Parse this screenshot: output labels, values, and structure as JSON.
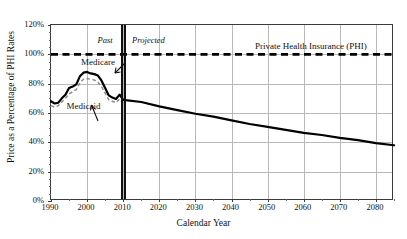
{
  "chart_data": {
    "type": "line",
    "title": "",
    "xlabel": "Calendar Year",
    "ylabel": "Price as a Percentage of PHI Rates",
    "xlim": [
      1990,
      2085
    ],
    "ylim": [
      0,
      120
    ],
    "grid": true,
    "legend_position": "inline-annotations",
    "xticks": [
      1990,
      2000,
      2010,
      2020,
      2030,
      2040,
      2050,
      2060,
      2070,
      2080
    ],
    "xtick_labels": [
      "1990",
      "2000",
      "2010",
      "2020",
      "2030",
      "2040",
      "2050",
      "2060",
      "2070",
      "2080"
    ],
    "yticks": [
      0,
      20,
      40,
      60,
      80,
      100,
      120
    ],
    "ytick_labels": [
      "0%",
      "20%",
      "40%",
      "60%",
      "80%",
      "100%",
      "120%"
    ],
    "annotations": [
      {
        "name": "past",
        "text": "Past",
        "x": 2005,
        "y": 110,
        "style": "italic"
      },
      {
        "name": "projected",
        "text": "Projected",
        "x": 2017,
        "y": 110,
        "style": "italic"
      },
      {
        "name": "phi-line-label",
        "text": "Private Health Insurance (PHI)",
        "x": 2062,
        "y": 106
      },
      {
        "name": "medicare-label",
        "text": "Medicare",
        "x": 2003,
        "y": 95
      },
      {
        "name": "medicaid-label",
        "text": "Medicaid",
        "x": 1999,
        "y": 65
      }
    ],
    "divider": {
      "label": "Past / Projected boundary",
      "x": 2010
    },
    "series": [
      {
        "name": "Private Health Insurance (PHI)",
        "style": "dashed-thick-black",
        "color": "#000000",
        "constant_value": 100,
        "x": [
          1990,
          2085
        ],
        "values": [
          100,
          100
        ]
      },
      {
        "name": "Medicare",
        "style": "solid-thick-black",
        "color": "#000000",
        "x": [
          1990,
          1991,
          1992,
          1993,
          1994,
          1995,
          1996,
          1997,
          1998,
          1999,
          2000,
          2001,
          2002,
          2003,
          2004,
          2005,
          2006,
          2007,
          2008,
          2009,
          2010,
          2015,
          2020,
          2025,
          2030,
          2035,
          2040,
          2045,
          2050,
          2055,
          2060,
          2065,
          2070,
          2075,
          2080,
          2085
        ],
        "values": [
          68,
          66.5,
          67,
          70,
          72.5,
          77,
          78,
          79.5,
          85,
          87.5,
          88,
          87,
          86.5,
          85.5,
          82,
          77,
          72,
          70.5,
          69.5,
          72.5,
          69,
          67.5,
          64.5,
          62,
          59.5,
          57.5,
          55,
          52.5,
          50.5,
          48.5,
          46.5,
          45,
          43,
          41.5,
          39.5,
          38
        ]
      },
      {
        "name": "Medicaid",
        "style": "dashed-gray",
        "color": "#8c8c8c",
        "x": [
          1990,
          1991,
          1992,
          1993,
          1994,
          1995,
          1996,
          1997,
          1998,
          1999,
          2000,
          2001,
          2002,
          2003,
          2004,
          2005,
          2006,
          2007,
          2008,
          2009,
          2010
        ],
        "values": [
          65,
          64,
          65,
          67.5,
          70,
          73,
          74.5,
          76,
          80.5,
          83,
          83.5,
          83,
          82.5,
          81,
          78,
          73.5,
          69,
          68,
          67,
          69.5,
          66.5
        ]
      }
    ]
  },
  "axes": {
    "y_title": "Price as a Percentage of PHI Rates",
    "x_title": "Calendar Year"
  }
}
